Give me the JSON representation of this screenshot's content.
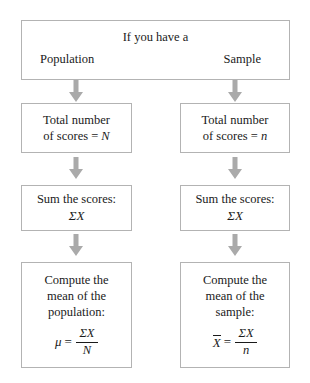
{
  "diagram": {
    "title_text": "If you have a",
    "branches": {
      "left_label": "Population",
      "right_label": "Sample"
    },
    "arrow_color": "#aaaaaa",
    "box_border_color": "#b3b3b3",
    "text_color": "#1a1a1a",
    "left_column": {
      "step1_line1": "Total number",
      "step1_line2_prefix": "of scores =",
      "step1_symbol": "N",
      "step2_line1": "Sum the scores:",
      "step2_line2": "ΣX",
      "step3_line1": "Compute the",
      "step3_line2": "mean of the",
      "step3_line3": "population:",
      "formula_lhs": "μ",
      "formula_eq": "=",
      "formula_numerator": "ΣX",
      "formula_denominator": "N"
    },
    "right_column": {
      "step1_line1": "Total number",
      "step1_line2_prefix": "of scores =",
      "step1_symbol": "n",
      "step2_line1": "Sum the scores:",
      "step2_line2": "ΣX",
      "step3_line1": "Compute the",
      "step3_line2": "mean of the",
      "step3_line3": "sample:",
      "formula_lhs": "X",
      "formula_eq": "=",
      "formula_numerator": "ΣX",
      "formula_denominator": "n"
    }
  }
}
